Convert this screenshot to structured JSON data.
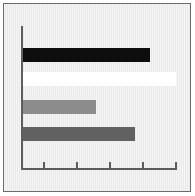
{
  "figure": {
    "title": "",
    "background_color": "#e9e9e9",
    "frame_color": "#6b6b6b",
    "axis_color": "#5d5d5d"
  },
  "chart_data": {
    "type": "bar",
    "orientation": "horizontal",
    "title": "",
    "subtitle": "",
    "xlabel": "",
    "ylabel": "",
    "categories": [
      "Bar 1",
      "Bar 2",
      "Bar 3",
      "Bar 4"
    ],
    "values": [
      3.85,
      4.65,
      2.2,
      3.4
    ],
    "colors": [
      "#0e0e0e",
      "#ffffff",
      "#8c8c8c",
      "#616161"
    ],
    "legend": [],
    "legend_position": "none",
    "grid": false,
    "xlim": [
      0,
      4.7
    ],
    "x_ticks": [
      1,
      2,
      3,
      4,
      5
    ],
    "x_tick_labels": [
      "",
      "",
      "",
      "",
      ""
    ],
    "y_ticks": [],
    "y_tick_labels": [],
    "annotations": []
  }
}
